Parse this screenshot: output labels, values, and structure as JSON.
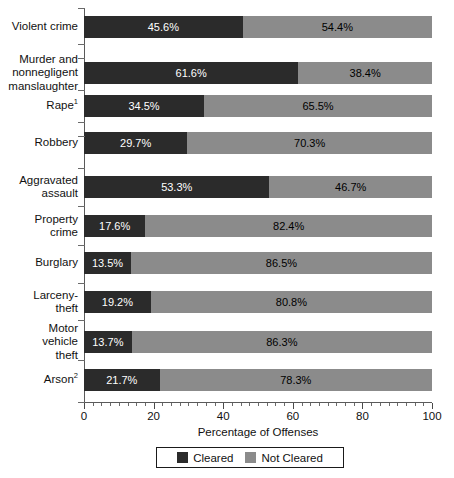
{
  "chart_data": {
    "type": "bar",
    "orientation": "horizontal",
    "stacked": true,
    "stacked_normalized": true,
    "title": "",
    "xlabel": "Percentage of Offenses",
    "ylabel": "",
    "xlim": [
      0,
      100
    ],
    "xticks": [
      0,
      20,
      40,
      60,
      80,
      100
    ],
    "xtick_labels": [
      "0",
      "20",
      "40",
      "60",
      "80",
      "100"
    ],
    "minor_tick_interval": 2.5,
    "grid": false,
    "legend_position": "bottom-center",
    "categories": [
      "Violent crime",
      "Murder and nonnegligent manslaughter",
      "Rape",
      "Robbery",
      "Aggravated assault",
      "Property crime",
      "Burglary",
      "Larceny-theft",
      "Motor vehicle theft",
      "Arson"
    ],
    "series": [
      {
        "name": "Cleared",
        "color": "#2b2b2b",
        "values": [
          45.6,
          61.6,
          34.5,
          29.7,
          53.3,
          17.6,
          13.5,
          19.2,
          13.7,
          21.7
        ]
      },
      {
        "name": "Not Cleared",
        "color": "#8b8b8b",
        "values": [
          54.4,
          38.4,
          65.5,
          70.3,
          46.7,
          82.4,
          86.5,
          80.8,
          86.3,
          78.3
        ]
      }
    ],
    "data_labels": {
      "cleared": [
        "45.6%",
        "61.6%",
        "34.5%",
        "29.7%",
        "53.3%",
        "17.6%",
        "13.5%",
        "19.2%",
        "13.7%",
        "21.7%"
      ],
      "not_cleared": [
        "54.4%",
        "38.4%",
        "65.5%",
        "70.3%",
        "46.7%",
        "82.4%",
        "86.5%",
        "80.8%",
        "86.3%",
        "78.3%"
      ]
    }
  },
  "axis": {
    "x_title": "Percentage of Offenses",
    "tick_labels": [
      "0",
      "20",
      "40",
      "60",
      "80",
      "100"
    ]
  },
  "legend": {
    "entries": [
      {
        "label": "Cleared",
        "color": "#2b2b2b",
        "swatch": "square-dark-swatch"
      },
      {
        "label": "Not Cleared",
        "color": "#8b8b8b",
        "swatch": "square-gray-swatch"
      }
    ]
  },
  "rows": [
    {
      "label_lines": [
        "Violent crime"
      ],
      "footnote": "",
      "cleared": 45.6,
      "not_cleared": 54.4,
      "cleared_label": "45.6%",
      "not_cleared_label": "54.4%"
    },
    {
      "label_lines": [
        "Murder and",
        "nonnegligent",
        "manslaughter"
      ],
      "footnote": "",
      "cleared": 61.6,
      "not_cleared": 38.4,
      "cleared_label": "61.6%",
      "not_cleared_label": "38.4%"
    },
    {
      "label_lines": [
        "Rape"
      ],
      "footnote": "1",
      "cleared": 34.5,
      "not_cleared": 65.5,
      "cleared_label": "34.5%",
      "not_cleared_label": "65.5%"
    },
    {
      "label_lines": [
        "Robbery"
      ],
      "footnote": "",
      "cleared": 29.7,
      "not_cleared": 70.3,
      "cleared_label": "29.7%",
      "not_cleared_label": "70.3%"
    },
    {
      "label_lines": [
        "Aggravated",
        "assault"
      ],
      "footnote": "",
      "cleared": 53.3,
      "not_cleared": 46.7,
      "cleared_label": "53.3%",
      "not_cleared_label": "46.7%"
    },
    {
      "label_lines": [
        "Property",
        "crime"
      ],
      "footnote": "",
      "cleared": 17.6,
      "not_cleared": 82.4,
      "cleared_label": "17.6%",
      "not_cleared_label": "82.4%"
    },
    {
      "label_lines": [
        "Burglary"
      ],
      "footnote": "",
      "cleared": 13.5,
      "not_cleared": 86.5,
      "cleared_label": "13.5%",
      "not_cleared_label": "86.5%"
    },
    {
      "label_lines": [
        "Larceny-",
        "theft"
      ],
      "footnote": "",
      "cleared": 19.2,
      "not_cleared": 80.8,
      "cleared_label": "19.2%",
      "not_cleared_label": "80.8%"
    },
    {
      "label_lines": [
        "Motor",
        "vehicle",
        "theft"
      ],
      "footnote": "",
      "cleared": 13.7,
      "not_cleared": 86.3,
      "cleared_label": "13.7%",
      "not_cleared_label": "86.3%"
    },
    {
      "label_lines": [
        "Arson"
      ],
      "footnote": "2",
      "cleared": 21.7,
      "not_cleared": 78.3,
      "cleared_label": "21.7%",
      "not_cleared_label": "78.3%"
    }
  ],
  "geometry": {
    "plot_left": 84,
    "plot_width": 348,
    "plot_top": 8,
    "plot_bottom": 402,
    "bar_height": 22,
    "row_centers": [
      27,
      73,
      106,
      143,
      187,
      226,
      263,
      302,
      342,
      380
    ],
    "tick_positions": [
      8,
      44,
      58,
      90,
      122,
      136,
      168,
      206,
      245,
      283,
      320,
      360,
      402
    ]
  }
}
